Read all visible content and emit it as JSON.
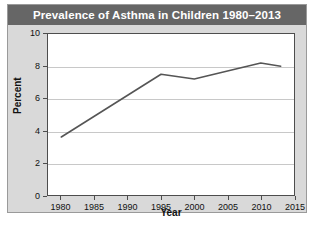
{
  "chart_data": {
    "type": "line",
    "title": "Prevalence of Asthma in Children 1980–2013",
    "xlabel": "Year",
    "ylabel": "Percent",
    "xlim": [
      1978,
      2015
    ],
    "ylim": [
      0,
      10
    ],
    "xticks": [
      1980,
      1985,
      1990,
      1995,
      2000,
      2005,
      2010,
      2015
    ],
    "yticks": [
      0,
      2,
      4,
      6,
      8,
      10
    ],
    "grid": "horizontal",
    "legend": "none",
    "line_color": "#555555",
    "x": [
      1980,
      1995,
      2000,
      2010,
      2013
    ],
    "values": [
      3.6,
      7.5,
      7.2,
      8.2,
      8.0
    ],
    "series": [
      {
        "name": "Percent of children with asthma",
        "points": [
          {
            "x": 1980,
            "y": 3.6
          },
          {
            "x": 1995,
            "y": 7.5
          },
          {
            "x": 2000,
            "y": 7.2
          },
          {
            "x": 2010,
            "y": 8.2
          },
          {
            "x": 2013,
            "y": 8.0
          }
        ]
      }
    ]
  },
  "figure": {
    "title": "Prevalence of Asthma in Children 1980–2013",
    "axis": {
      "y_label": "Percent",
      "x_label": "Year",
      "y_tick_labels": [
        "10",
        "8",
        "6",
        "4",
        "2",
        "0"
      ],
      "x_tick_labels": [
        "1980",
        "1985",
        "1990",
        "1995",
        "2000",
        "2005",
        "2010",
        "2015"
      ]
    },
    "colors": {
      "title_band": "#666666",
      "title_text": "#ffffff",
      "panel": "#d9d9d9",
      "plot_background": "#ffffff",
      "plot_border": "#4d4d4d",
      "gridline": "#c8c8c8",
      "data_line": "#555555"
    }
  }
}
